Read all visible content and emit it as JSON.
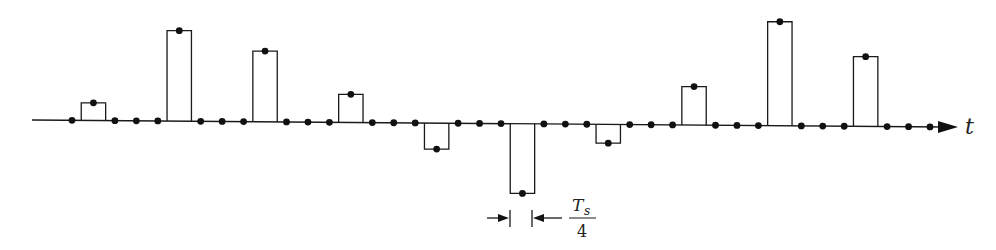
{
  "diagram": {
    "type": "flat-top sampled signal",
    "axis_label": "t",
    "annotation": {
      "numerator": "T",
      "subscript": "s",
      "denominator": "4",
      "meaning": "pulse width / dot spacing = T_s/4"
    },
    "colors": {
      "ink": "#1a1a1a",
      "background": "#ffffff"
    }
  },
  "chart_data": {
    "type": "bar",
    "title": "",
    "xlabel": "t",
    "ylabel": "",
    "grid": false,
    "time_step": "T_s/4",
    "sample_count": 41,
    "pulse_period_samples": 4,
    "pulse_indices": [
      1,
      5,
      9,
      13,
      17,
      21,
      25,
      29,
      33,
      37
    ],
    "pulse_amplitudes": [
      0.17,
      0.87,
      0.68,
      0.27,
      -0.25,
      -0.67,
      -0.18,
      0.37,
      1.0,
      0.67
    ],
    "ylim": [
      -1.0,
      1.0
    ]
  }
}
